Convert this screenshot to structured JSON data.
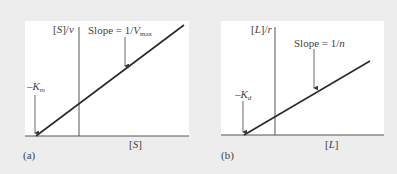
{
  "panels": [
    {
      "id": "a",
      "tag": "(a)",
      "y_label_pre": "[",
      "y_label_var": "S",
      "y_label_post": "]/",
      "y_label_var2": "v",
      "x_label_pre": "[",
      "x_label_var": "S",
      "x_label_post": "]",
      "slope_pre": "Slope = 1/",
      "slope_var": "V",
      "slope_sub": "max",
      "intercept_pre": "–",
      "intercept_var": "K",
      "intercept_sub": "m"
    },
    {
      "id": "b",
      "tag": "(b)",
      "y_label_pre": "[",
      "y_label_var": "L",
      "y_label_post": "]/",
      "y_label_var2": "r",
      "x_label_pre": "[",
      "x_label_var": "L",
      "x_label_post": "]",
      "slope_pre": "Slope = 1/",
      "slope_var": "n",
      "slope_sub": "",
      "intercept_pre": "–",
      "intercept_var": "K",
      "intercept_sub": "d"
    }
  ],
  "colors": {
    "background": "#ededed",
    "panel": "#ffffff",
    "line": "#2a2a2a"
  }
}
